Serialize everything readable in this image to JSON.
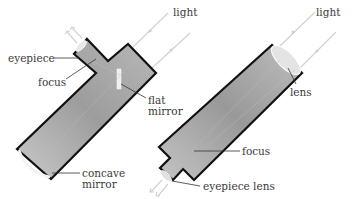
{
  "diagram": {
    "colors": {
      "tube_fill": "#a9a9a9",
      "tube_outline": "#111111",
      "light_ray": "#cfcfcf",
      "leader_line": "#333333",
      "label_text": "#3a3a3a"
    },
    "reflector": {
      "labels": {
        "light": "light",
        "eyepiece": "eyepiece",
        "focus": "focus",
        "flat_mirror_1": "flat",
        "flat_mirror_2": "mirror",
        "concave_mirror_1": "concave",
        "concave_mirror_2": "mirror"
      }
    },
    "refractor": {
      "labels": {
        "light": "light",
        "lens": "lens",
        "focus": "focus",
        "eyepiece_lens": "eyepiece lens"
      }
    }
  }
}
